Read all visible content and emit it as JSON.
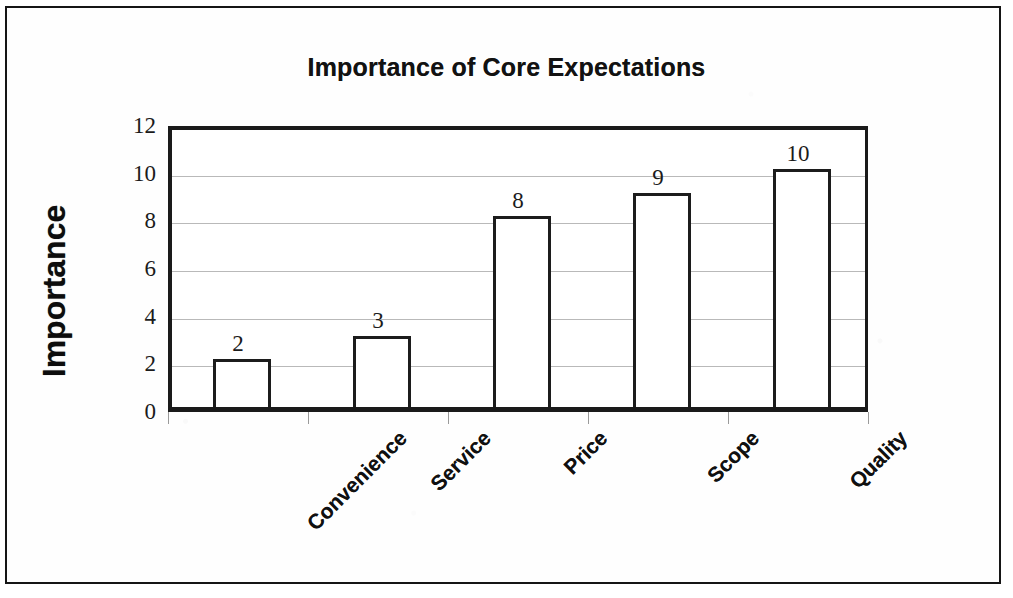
{
  "document": {
    "frame_border_color": "#151515",
    "background_color": "#ffffff"
  },
  "chart_data": {
    "type": "bar",
    "title": "Importance of Core Expectations",
    "xlabel": "",
    "ylabel": "Importance",
    "categories": [
      "Convenience",
      "Service",
      "Price",
      "Scope",
      "Quality"
    ],
    "values": [
      2,
      3,
      8,
      9,
      10
    ],
    "data_labels": [
      "2",
      "3",
      "8",
      "9",
      "10"
    ],
    "ylim": [
      0,
      12
    ],
    "ytick_labels": [
      "0",
      "2",
      "4",
      "6",
      "8",
      "10",
      "12"
    ],
    "ytick_values": [
      0,
      2,
      4,
      6,
      8,
      10,
      12
    ],
    "grid": true,
    "grid_axis": "y",
    "gridline_color": "#b9b9b9",
    "legend": false,
    "bar_fill_color": "#ffffff",
    "bar_outline_color": "#1c1c1c",
    "axis_color": "#1a1a1a",
    "plot_border": true,
    "xtick_label_rotation": -45
  }
}
